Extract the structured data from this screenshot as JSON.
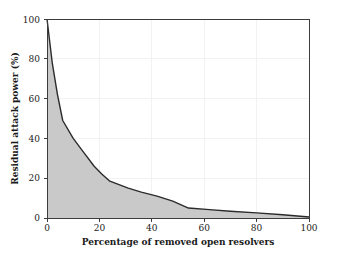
{
  "chart_data": {
    "type": "area",
    "title": "",
    "xlabel": "Percentage of removed open resolvers",
    "ylabel": "Residual attack power (%)",
    "xlim": [
      0,
      100
    ],
    "ylim": [
      0,
      100
    ],
    "xticks": [
      0,
      20,
      40,
      60,
      80,
      100
    ],
    "yticks": [
      0,
      20,
      40,
      60,
      80,
      100
    ],
    "xticklabels": [
      "0",
      "20",
      "40",
      "60",
      "80",
      "100"
    ],
    "yticklabels": [
      "0",
      "20",
      "40",
      "60",
      "80",
      "100"
    ],
    "grid": true,
    "legend": null,
    "series": [
      {
        "name": "Residual attack power",
        "x": [
          0,
          2,
          4,
          6,
          10,
          14,
          18,
          21,
          24,
          27,
          31,
          36,
          42,
          48,
          54,
          62,
          70,
          80,
          90,
          100
        ],
        "values": [
          100,
          78,
          62,
          49,
          40,
          33,
          26,
          22,
          18.5,
          17,
          15,
          13,
          11,
          8.5,
          5,
          4.2,
          3.4,
          2.6,
          1.6,
          0.5
        ],
        "fill_color": "#c9c9c9",
        "line_color": "#2b2b2b"
      }
    ],
    "colors": {
      "area_fill": "#c9c9c9",
      "line": "#2b2b2b",
      "axis": "#3c3c3c",
      "grid": "#f2f2f2",
      "background": "#ffffff",
      "text": "#1a1a1a"
    },
    "annotations": []
  }
}
